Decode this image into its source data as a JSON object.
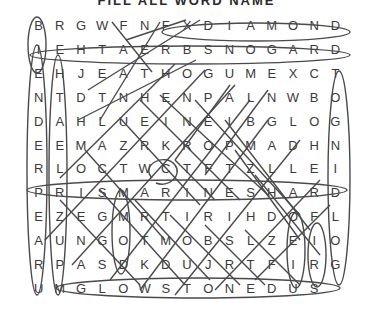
{
  "title": "FILL ALL  WORD NAME",
  "puzzle": {
    "rows": 12,
    "cols": 15,
    "grid": [
      [
        "B",
        "R",
        "G",
        "W",
        "F",
        "N",
        "F",
        "X",
        "D",
        "I",
        "A",
        "M",
        "O",
        "N",
        "D"
      ],
      [
        "I",
        "E",
        "H",
        "T",
        "A",
        "E",
        "R",
        "B",
        "S",
        "N",
        "O",
        "G",
        "A",
        "R",
        "D"
      ],
      [
        "E",
        "H",
        "J",
        "E",
        "A",
        "T",
        "H",
        "O",
        "G",
        "U",
        "M",
        "E",
        "X",
        "C",
        "T"
      ],
      [
        "N",
        "T",
        "D",
        "T",
        "N",
        "H",
        "E",
        "N",
        "P",
        "A",
        "L",
        "N",
        "W",
        "B",
        "O"
      ],
      [
        "D",
        "A",
        "H",
        "L",
        "U",
        "E",
        "I",
        "N",
        "E",
        "I",
        "B",
        "G",
        "L",
        "O",
        "G"
      ],
      [
        "E",
        "E",
        "M",
        "A",
        "Z",
        "R",
        "K",
        "R",
        "O",
        "P",
        "M",
        "A",
        "D",
        "H",
        "N"
      ],
      [
        "R",
        "L",
        "O",
        "C",
        "T",
        "W",
        "C",
        "T",
        "F",
        "T",
        "Z",
        "L",
        "L",
        "E",
        "I"
      ],
      [
        "P",
        "R",
        "I",
        "S",
        "M",
        "A",
        "R",
        "I",
        "N",
        "E",
        "S",
        "H",
        "A",
        "R",
        "D"
      ],
      [
        "E",
        "Z",
        "E",
        "G",
        "M",
        "R",
        "T",
        "I",
        "R",
        "I",
        "H",
        "D",
        "O",
        "F",
        "L"
      ],
      [
        "A",
        "U",
        "N",
        "G",
        "O",
        "T",
        "M",
        "O",
        "B",
        "S",
        "L",
        "Z",
        "E",
        "I",
        "O"
      ],
      [
        "R",
        "P",
        "A",
        "S",
        "D",
        "K",
        "D",
        "U",
        "J",
        "R",
        "T",
        "F",
        "I",
        "R",
        "G"
      ],
      [
        "U",
        "M",
        "G",
        "L",
        "O",
        "W",
        "S",
        "T",
        "O",
        "N",
        "E",
        "D",
        "U",
        "S",
        ""
      ]
    ],
    "found_words": [
      "DIAMOND",
      "DRAGON BREATH",
      "PRISMARINE SHARD",
      "GLOWSTONE DUST",
      "GOLD INGOT"
    ],
    "ink_color": "#4a4a4a",
    "letter_color": "#3a3a3a"
  }
}
